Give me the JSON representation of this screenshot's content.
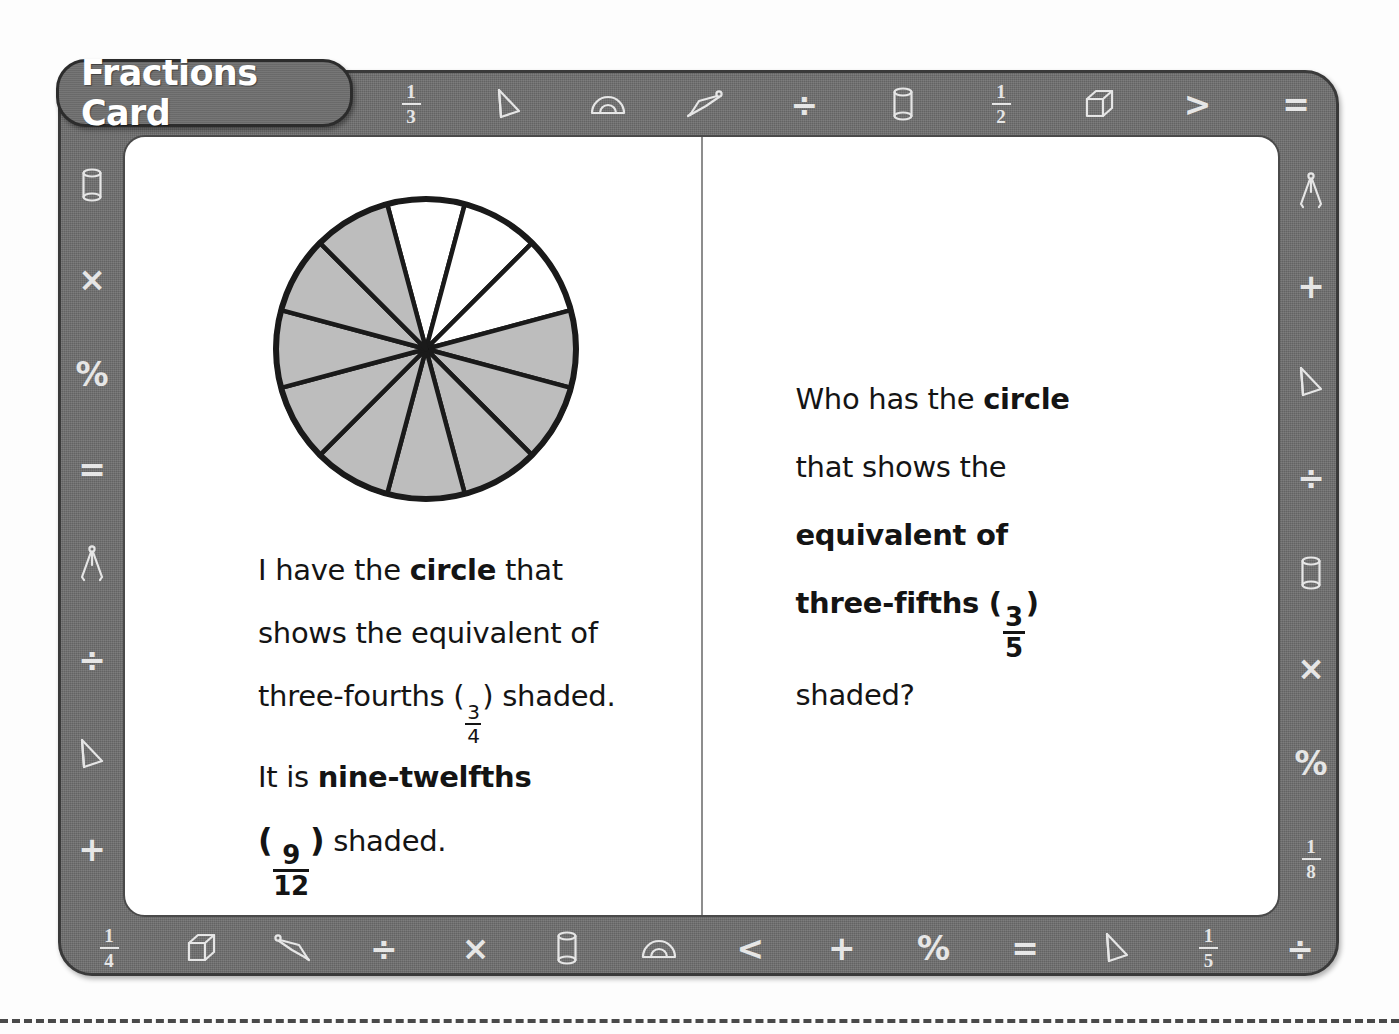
{
  "card": {
    "title": "Fractions Card",
    "frame_color": "#6f6f6f",
    "frame_outline_color": "#2c2c2c",
    "paper_color": "#ffffff",
    "text_color": "#141414"
  },
  "top_icons": [
    {
      "name": "fraction-one-third",
      "type": "fraction",
      "numerator": "1",
      "denominator": "3"
    },
    {
      "name": "set-square-icon",
      "type": "triangle"
    },
    {
      "name": "protractor-icon",
      "type": "protractor"
    },
    {
      "name": "compass-icon",
      "type": "compass-open"
    },
    {
      "name": "division-sign",
      "type": "symbol",
      "glyph": "÷"
    },
    {
      "name": "cylinder-icon",
      "type": "cylinder"
    },
    {
      "name": "fraction-one-half",
      "type": "fraction",
      "numerator": "1",
      "denominator": "2"
    },
    {
      "name": "cube-icon",
      "type": "cube"
    },
    {
      "name": "greater-than-sign",
      "type": "symbol",
      "glyph": ">"
    },
    {
      "name": "equals-sign",
      "type": "symbol",
      "glyph": "="
    }
  ],
  "left_icons": [
    {
      "name": "cylinder-icon",
      "type": "cylinder"
    },
    {
      "name": "multiplication-sign",
      "type": "symbol",
      "glyph": "×"
    },
    {
      "name": "percent-sign",
      "type": "symbol",
      "glyph": "%"
    },
    {
      "name": "equals-sign",
      "type": "symbol",
      "glyph": "="
    },
    {
      "name": "compass-icon",
      "type": "compass-closed"
    },
    {
      "name": "division-sign",
      "type": "symbol",
      "glyph": "÷"
    },
    {
      "name": "set-square-icon",
      "type": "triangle"
    },
    {
      "name": "plus-sign",
      "type": "symbol",
      "glyph": "+"
    }
  ],
  "right_icons": [
    {
      "name": "compass-icon",
      "type": "compass-closed"
    },
    {
      "name": "plus-sign",
      "type": "symbol",
      "glyph": "+"
    },
    {
      "name": "set-square-icon",
      "type": "triangle"
    },
    {
      "name": "division-sign",
      "type": "symbol",
      "glyph": "÷"
    },
    {
      "name": "cylinder-icon",
      "type": "cylinder"
    },
    {
      "name": "multiplication-sign",
      "type": "symbol",
      "glyph": "×"
    },
    {
      "name": "percent-sign",
      "type": "symbol",
      "glyph": "%"
    },
    {
      "name": "fraction-one-eighth",
      "type": "fraction",
      "numerator": "1",
      "denominator": "8"
    }
  ],
  "bottom_icons": [
    {
      "name": "fraction-one-fourth",
      "type": "fraction",
      "numerator": "1",
      "denominator": "4"
    },
    {
      "name": "cube-icon",
      "type": "cube"
    },
    {
      "name": "compass-icon",
      "type": "compass-open-left"
    },
    {
      "name": "division-sign",
      "type": "symbol",
      "glyph": "÷"
    },
    {
      "name": "multiplication-sign",
      "type": "symbol",
      "glyph": "×"
    },
    {
      "name": "cylinder-icon",
      "type": "cylinder"
    },
    {
      "name": "protractor-icon",
      "type": "protractor"
    },
    {
      "name": "less-than-sign",
      "type": "symbol",
      "glyph": "<"
    },
    {
      "name": "plus-sign",
      "type": "symbol",
      "glyph": "+"
    },
    {
      "name": "percent-sign",
      "type": "symbol",
      "glyph": "%"
    },
    {
      "name": "equals-sign",
      "type": "symbol",
      "glyph": "="
    },
    {
      "name": "set-square-icon",
      "type": "triangle"
    },
    {
      "name": "fraction-one-fifth",
      "type": "fraction",
      "numerator": "1",
      "denominator": "5"
    },
    {
      "name": "division-sign",
      "type": "symbol",
      "glyph": "÷"
    }
  ],
  "left_panel": {
    "statement": {
      "line1_a": "I have the ",
      "line1_bold": "circle",
      "line1_b": " that",
      "line2": "shows the equivalent of",
      "line3_a": "three-fourths (",
      "line3_frac_num": "3",
      "line3_frac_den": "4",
      "line3_b": ") shaded.",
      "line4_a": "It is ",
      "line4_bold": "nine-twelfths",
      "line5_open": "(",
      "line5_frac_num": "9",
      "line5_frac_den": "12",
      "line5_close": ")",
      "line5_tail": " shaded."
    }
  },
  "right_panel": {
    "question": {
      "line1_a": "Who has the ",
      "line1_bold": "circle",
      "line2": "that shows the",
      "line3_bold": "equivalent of",
      "line4_bold": "three-fifths (",
      "line4_frac_num": "3",
      "line4_frac_den": "5",
      "line4_close": ")",
      "line5": "shaded?"
    }
  },
  "chart_data": {
    "type": "pie",
    "total_sectors": 12,
    "shaded_sectors": 9,
    "unshaded_sectors": 3,
    "fraction_shaded": "9/12",
    "equivalent_fraction": "3/4",
    "categories": [
      "shaded",
      "unshaded"
    ],
    "values": [
      9,
      3
    ],
    "colors": {
      "shaded": "#bdbdbd",
      "unshaded": "#ffffff",
      "outline": "#1a1a1a"
    },
    "unshaded_sector_indices": [
      0,
      1,
      2
    ],
    "sector_angle_degrees": 30,
    "start_angle_degrees": -15,
    "legend": "none",
    "grid": false
  }
}
